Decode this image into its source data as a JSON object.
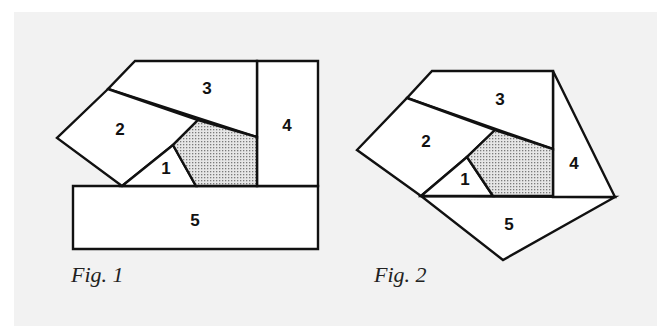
{
  "figures": [
    {
      "caption": "Fig. 1",
      "pieces": [
        {
          "label": "1"
        },
        {
          "label": "2"
        },
        {
          "label": "3"
        },
        {
          "label": "4"
        },
        {
          "label": "5"
        }
      ],
      "shaded_region": "dotted-pentagon"
    },
    {
      "caption": "Fig. 2",
      "pieces": [
        {
          "label": "1"
        },
        {
          "label": "2"
        },
        {
          "label": "3"
        },
        {
          "label": "4"
        },
        {
          "label": "5"
        }
      ],
      "shaded_region": "dotted-pentagon"
    }
  ],
  "colors": {
    "background": "#f2f2f2",
    "outline": "#111111",
    "piece_fill": "#ffffff",
    "shading": "#9a9a9a"
  }
}
